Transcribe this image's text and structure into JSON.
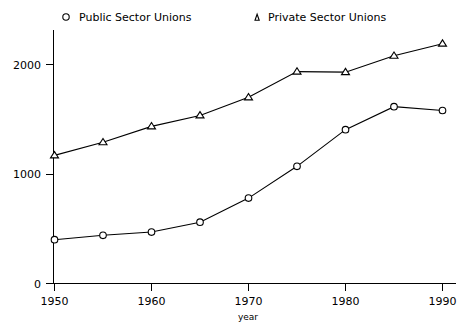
{
  "chart_data": {
    "type": "line",
    "title": "",
    "xlabel": "year",
    "ylabel": "",
    "x": [
      1950,
      1955,
      1960,
      1965,
      1970,
      1975,
      1980,
      1985,
      1990
    ],
    "xlim": [
      1950,
      1990
    ],
    "ylim": [
      0,
      2300
    ],
    "xticks": [
      "1950",
      "1960",
      "1970",
      "1980",
      "1990"
    ],
    "xtick_values": [
      1950,
      1960,
      1970,
      1980,
      1990
    ],
    "yticks": [
      "0",
      "1000",
      "2000"
    ],
    "ytick_values": [
      0,
      1000,
      2000
    ],
    "grid": false,
    "legend_position": "top",
    "series": [
      {
        "name": "Public Sector Unions",
        "marker": "circle",
        "values": [
          400,
          440,
          470,
          560,
          780,
          1070,
          1405,
          1615,
          1580
        ]
      },
      {
        "name": "Private Sector Unions",
        "marker": "triangle",
        "values": [
          1170,
          1290,
          1435,
          1535,
          1700,
          1935,
          1930,
          2080,
          2190
        ]
      }
    ]
  },
  "legend": {
    "entries": [
      {
        "label": "Public Sector Unions",
        "marker": "circle-marker-icon"
      },
      {
        "label": "Private Sector Unions",
        "marker": "triangle-marker-icon"
      }
    ]
  },
  "axes": {
    "x_title": "year",
    "x_tick_labels": [
      "1950",
      "1960",
      "1970",
      "1980",
      "1990"
    ],
    "y_tick_labels": [
      "0",
      "1000",
      "2000"
    ]
  },
  "colors": {
    "line": "#000000",
    "marker_fill": "#ffffff",
    "axis": "#000000",
    "background": "#ffffff"
  }
}
